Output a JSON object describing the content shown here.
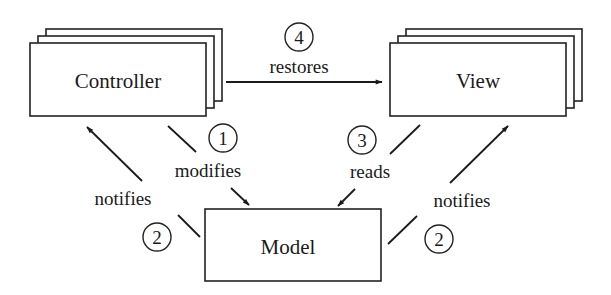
{
  "diagram": {
    "title": "",
    "nodes": {
      "controller": {
        "label": "Controller"
      },
      "view": {
        "label": "View"
      },
      "model": {
        "label": "Model"
      }
    },
    "edges": [
      {
        "id": "restores",
        "step": "4",
        "label": "restores",
        "from": "controller",
        "to": "view"
      },
      {
        "id": "modifies",
        "step": "1",
        "label": "modifies",
        "from": "controller",
        "to": "model"
      },
      {
        "id": "reads",
        "step": "3",
        "label": "reads",
        "from": "view",
        "to": "model"
      },
      {
        "id": "notifies_controller",
        "step": "2",
        "label": "notifies",
        "from": "model",
        "to": "controller"
      },
      {
        "id": "notifies_view",
        "step": "2",
        "label": "notifies",
        "from": "model",
        "to": "view"
      }
    ]
  }
}
